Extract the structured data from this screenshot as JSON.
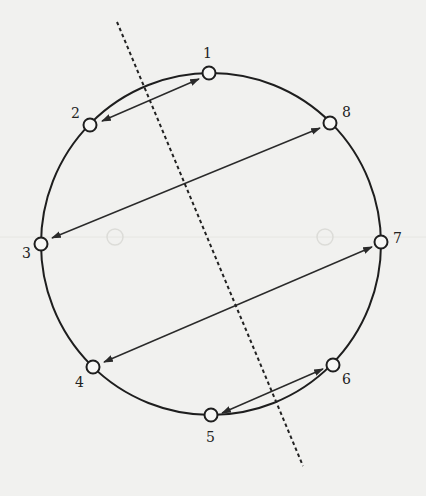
{
  "diagram": {
    "type": "circular-graph-reflection",
    "colors": {
      "background": "#f1f1ef",
      "stroke": "#1e1e1e",
      "node_fill": "#f7f7f5"
    },
    "nodes": [
      {
        "id": "1",
        "label": "1",
        "x": 209,
        "y": 73,
        "label_x": 203,
        "label_y": 58
      },
      {
        "id": "2",
        "label": "2",
        "x": 90,
        "y": 125,
        "label_x": 71,
        "label_y": 118
      },
      {
        "id": "3",
        "label": "3",
        "x": 41,
        "y": 244,
        "label_x": 22,
        "label_y": 258
      },
      {
        "id": "4",
        "label": "4",
        "x": 93,
        "y": 367,
        "label_x": 75,
        "label_y": 387
      },
      {
        "id": "5",
        "label": "5",
        "x": 211,
        "y": 415,
        "label_x": 206,
        "label_y": 442
      },
      {
        "id": "6",
        "label": "6",
        "x": 333,
        "y": 365,
        "label_x": 342,
        "label_y": 384
      },
      {
        "id": "7",
        "label": "7",
        "x": 381,
        "y": 242,
        "label_x": 393,
        "label_y": 243
      },
      {
        "id": "8",
        "label": "8",
        "x": 330,
        "y": 123,
        "label_x": 342,
        "label_y": 117
      }
    ],
    "arrows": [
      {
        "from": "1",
        "to": "2",
        "x1": 199,
        "y1": 79,
        "x2": 102,
        "y2": 121
      },
      {
        "from": "8",
        "to": "3",
        "x1": 320,
        "y1": 128,
        "x2": 52,
        "y2": 238
      },
      {
        "from": "7",
        "to": "4",
        "x1": 372,
        "y1": 247,
        "x2": 104,
        "y2": 362
      },
      {
        "from": "6",
        "to": "5",
        "x1": 323,
        "y1": 369,
        "x2": 222,
        "y2": 413
      }
    ],
    "axis": {
      "style": "dashed",
      "x1": 117,
      "y1": 22,
      "x2": 303,
      "y2": 466
    }
  }
}
